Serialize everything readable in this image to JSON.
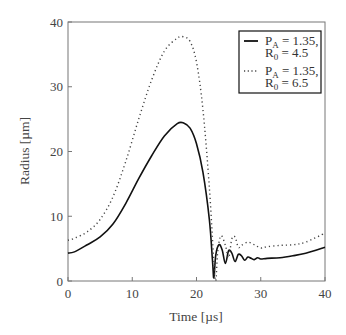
{
  "chart_data": {
    "type": "line",
    "title": "",
    "xlabel": "Time  [µs]",
    "ylabel": "Radius  [µm]",
    "xlim": [
      0,
      40
    ],
    "ylim": [
      0,
      40
    ],
    "xticks": [
      "0",
      "10",
      "20",
      "30",
      "40"
    ],
    "yticks": [
      "0",
      "10",
      "20",
      "30",
      "40"
    ],
    "grid": false,
    "legend_position": "upper right",
    "series": [
      {
        "name": "PA = 1.35, R0 = 4.5",
        "style": "solid",
        "x": [
          0,
          1,
          3,
          5,
          7,
          9,
          11,
          13,
          15,
          17,
          18,
          19,
          20,
          21,
          22,
          22.5,
          22.7,
          23,
          23.5,
          24,
          24.5,
          25,
          25.5,
          26,
          26.5,
          27,
          27.5,
          28,
          28.5,
          29,
          29.5,
          30,
          31,
          33,
          35,
          37,
          40
        ],
        "y": [
          4.3,
          4.5,
          5.6,
          6.8,
          8.8,
          12.0,
          15.8,
          19.3,
          22.4,
          24.3,
          24.4,
          23.6,
          21.2,
          16.8,
          9.5,
          3.0,
          0.5,
          4.0,
          5.6,
          4.8,
          2.7,
          4.7,
          4.3,
          3.0,
          4.1,
          3.9,
          3.2,
          3.7,
          3.5,
          3.3,
          3.6,
          3.4,
          3.5,
          3.6,
          3.9,
          4.3,
          5.2
        ]
      },
      {
        "name": "PA = 1.35, R0 = 6.5",
        "style": "dotted",
        "x": [
          0,
          1,
          3,
          5,
          7,
          9,
          11,
          13,
          15,
          17,
          18,
          19,
          20,
          21,
          22,
          22.7,
          23.0,
          23.3,
          23.8,
          24.5,
          25,
          25.5,
          26,
          26.5,
          27,
          28,
          29,
          30,
          31,
          33,
          35,
          37,
          40
        ],
        "y": [
          6.3,
          6.6,
          7.6,
          9.5,
          13.0,
          18.5,
          25.0,
          31.0,
          35.5,
          37.5,
          37.7,
          37.0,
          33.8,
          26.5,
          14.5,
          3.0,
          0.0,
          4.5,
          7.0,
          5.5,
          3.6,
          6.5,
          6.8,
          5.2,
          5.5,
          6.0,
          5.6,
          5.1,
          5.3,
          5.5,
          5.6,
          6.0,
          7.4
        ]
      }
    ],
    "legend": [
      {
        "style": "solid",
        "line1_main": "P",
        "line1_sub": "A",
        "line1_rest": " = 1.35,",
        "line2_main": "R",
        "line2_sub": "0",
        "line2_rest": " = 4.5"
      },
      {
        "style": "dotted",
        "line1_main": "P",
        "line1_sub": "A",
        "line1_rest": " = 1.35,",
        "line2_main": "R",
        "line2_sub": "0",
        "line2_rest": " = 6.5"
      }
    ]
  }
}
